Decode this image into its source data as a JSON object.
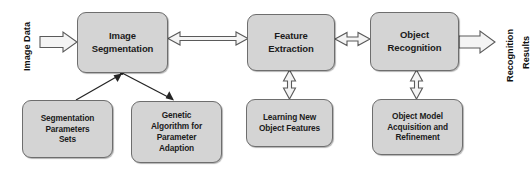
{
  "diagram": {
    "colors": {
      "node_fill": "#d4d4d4",
      "node_border": "#6e6e6e",
      "arrow_fill": "#f2f2f2",
      "arrow_stroke": "#4d4d4d",
      "line_stroke": "#2b2b2b",
      "text": "#1b1b1b",
      "background": "#ffffff"
    },
    "labels": [
      {
        "id": "image-data",
        "text": "Image Data",
        "orientation": "vertical"
      },
      {
        "id": "recognition-results-line1",
        "text": "Recognition",
        "orientation": "vertical"
      },
      {
        "id": "recognition-results-line2",
        "text": "Results",
        "orientation": "vertical"
      }
    ],
    "nodes": [
      {
        "id": "image-segmentation",
        "row": "main",
        "lines": [
          "Image",
          "Segmentation"
        ]
      },
      {
        "id": "feature-extraction",
        "row": "main",
        "lines": [
          "Feature",
          "Extraction"
        ]
      },
      {
        "id": "object-recognition",
        "row": "main",
        "lines": [
          "Object",
          "Recognition"
        ]
      },
      {
        "id": "segmentation-parameters-sets",
        "row": "support",
        "lines": [
          "Segmentation",
          "Parameters",
          "Sets"
        ]
      },
      {
        "id": "genetic-algorithm",
        "row": "support",
        "lines": [
          "Genetic",
          "Algorithm for",
          "Parameter",
          "Adaption"
        ]
      },
      {
        "id": "learning-new-object-features",
        "row": "support",
        "lines": [
          "Learning New",
          "Object Features"
        ]
      },
      {
        "id": "object-model",
        "row": "support",
        "lines": [
          "Object Model",
          "Acquisition and",
          "Refinement"
        ]
      }
    ],
    "connectors": [
      {
        "id": "input-arrow",
        "from": "image-data",
        "to": "image-segmentation",
        "style": "hollow-block",
        "direction": "right"
      },
      {
        "id": "seg-to-feature",
        "from": "image-segmentation",
        "to": "feature-extraction",
        "style": "open-line",
        "direction": "bidirectional"
      },
      {
        "id": "feature-to-object",
        "from": "feature-extraction",
        "to": "object-recognition",
        "style": "open-line",
        "direction": "bidirectional"
      },
      {
        "id": "object-to-output",
        "from": "object-recognition",
        "to": "recognition-results",
        "style": "hollow-block",
        "direction": "right"
      },
      {
        "id": "params-to-seg",
        "from": "segmentation-parameters-sets",
        "to": "image-segmentation",
        "style": "thin-line",
        "direction": "up"
      },
      {
        "id": "seg-to-genetic",
        "from": "image-segmentation",
        "to": "genetic-algorithm",
        "style": "thin-line",
        "direction": "down"
      },
      {
        "id": "learning-feature",
        "from": "learning-new-object-features",
        "to": "feature-extraction",
        "style": "hollow-block",
        "direction": "bidirectional"
      },
      {
        "id": "objectmodel-recognition",
        "from": "object-model",
        "to": "object-recognition",
        "style": "hollow-block",
        "direction": "bidirectional"
      }
    ]
  }
}
